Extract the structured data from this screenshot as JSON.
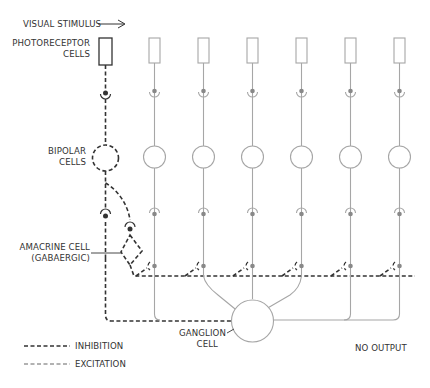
{
  "diagram": {
    "labels": {
      "stimulus": "VISUAL STIMULUS",
      "photoreceptor_line1": "PHOTORECEPTOR",
      "photoreceptor_line2": "CELLS",
      "bipolar_line1": "BIPOLAR",
      "bipolar_line2": "CELLS",
      "amacrine_line1": "AMACRINE CELL",
      "amacrine_line2": "(GABAERGIC)",
      "ganglion_line1": "GANGLION",
      "ganglion_line2": "CELL",
      "no_output": "NO OUTPUT"
    },
    "legend": {
      "inhibition": "INHIBITION",
      "excitation": "EXCITATION"
    },
    "columns": [
      {
        "index": 1,
        "state": "stimulated"
      },
      {
        "index": 2,
        "state": "unstimulated"
      },
      {
        "index": 3,
        "state": "unstimulated"
      },
      {
        "index": 4,
        "state": "unstimulated"
      },
      {
        "index": 5,
        "state": "unstimulated"
      },
      {
        "index": 6,
        "state": "unstimulated"
      },
      {
        "index": 7,
        "state": "unstimulated"
      }
    ],
    "colors": {
      "inhibition": "#333333",
      "excitation": "#555555",
      "inactive": "#a6a6a6"
    }
  }
}
